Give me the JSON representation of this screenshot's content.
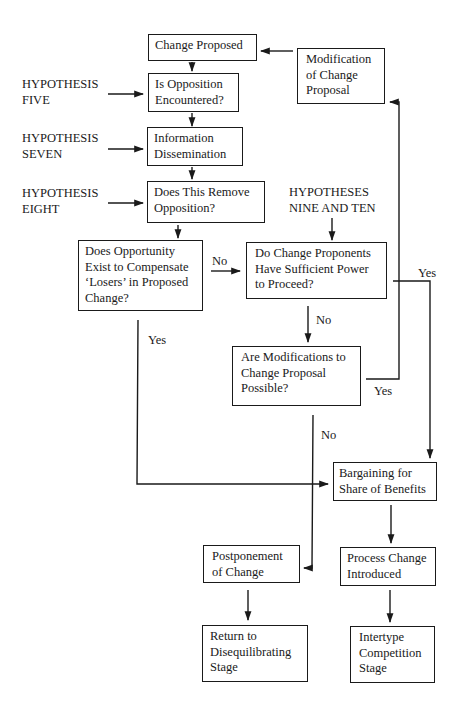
{
  "diagram": {
    "nodes": {
      "change_proposed": {
        "lines": [
          "Change Proposed"
        ]
      },
      "modification": {
        "lines": [
          "Modification",
          "of Change",
          "Proposal"
        ]
      },
      "is_opposition": {
        "lines": [
          "Is Opposition",
          "Encountered?"
        ]
      },
      "information": {
        "lines": [
          "Information",
          "Dissemination"
        ]
      },
      "does_remove": {
        "lines": [
          "Does This Remove",
          "Opposition?"
        ]
      },
      "does_opportunity": {
        "lines": [
          "Does Opportunity",
          "Exist to Compensate",
          "‘Losers’ in Proposed",
          "Change?"
        ]
      },
      "do_proponents": {
        "lines": [
          "Do Change Proponents",
          "Have Sufficient Power",
          "to Proceed?"
        ]
      },
      "are_modifications": {
        "lines": [
          "Are Modifications to",
          "Change Proposal",
          "Possible?"
        ]
      },
      "bargaining": {
        "lines": [
          "Bargaining for",
          "Share of Benefits"
        ]
      },
      "postponement": {
        "lines": [
          "Postponement",
          "of Change"
        ]
      },
      "process_change": {
        "lines": [
          "Process Change",
          "Introduced"
        ]
      },
      "return_to": {
        "lines": [
          "Return to",
          "Disequilibrating",
          "Stage"
        ]
      },
      "intertype": {
        "lines": [
          "Intertype",
          "Competition",
          "Stage"
        ]
      }
    },
    "hypotheses": {
      "five": {
        "lines": [
          "HYPOTHESIS",
          "FIVE"
        ]
      },
      "seven": {
        "lines": [
          "HYPOTHESIS",
          "SEVEN"
        ]
      },
      "eight": {
        "lines": [
          "HYPOTHESIS",
          "EIGHT"
        ]
      },
      "nine_ten": {
        "lines": [
          "HYPOTHESES",
          "NINE AND TEN"
        ]
      }
    },
    "edge_labels": {
      "opportunity_no": "No",
      "opportunity_yes": "Yes",
      "proponents_no": "No",
      "proponents_yes": "Yes",
      "modifications_yes": "Yes",
      "modifications_no": "No"
    },
    "colors": {
      "ink": "#1a1a1a",
      "background": "#ffffff"
    }
  }
}
